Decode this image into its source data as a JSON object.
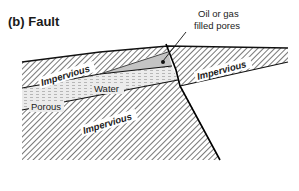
{
  "title": "(b) Fault",
  "annotation": {
    "line1": "Oil or gas",
    "line2": "filled pores"
  },
  "layers": {
    "upper_left_impervious": "Impervious",
    "right_impervious": "Impervious",
    "water": "Water",
    "porous": "Porous",
    "lower_impervious": "Impervious"
  },
  "colors": {
    "hatch": "#555555",
    "oil_gas_fill": "#c8c8c8",
    "porous_fill": "#e4e4e4",
    "line": "#111111"
  }
}
